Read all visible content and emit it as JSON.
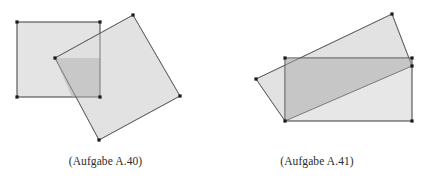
{
  "page": {
    "background_color": "#ffffff",
    "width": 423,
    "height": 186
  },
  "style": {
    "shape_fill": "#e2e2e2",
    "shape_fill_alt": "#e6e6e6",
    "overlap_fill": "#c9c9c9",
    "stroke_color": "#4a4a4a",
    "vertex_color": "#1a1a1a",
    "caption_color": "#2b2b2b"
  },
  "figures": [
    {
      "id": "a40",
      "caption": "(Aufgabe A.40)",
      "shapes": [
        {
          "name": "axis-aligned-square",
          "points": "17,22 100,22 100,97 17,97",
          "vertices": [
            [
              17,
              22
            ],
            [
              100,
              22
            ],
            [
              100,
              97
            ],
            [
              17,
              97
            ]
          ]
        },
        {
          "name": "rotated-square",
          "points": "133,15 180,96 99,140 55,58",
          "vertices": [
            [
              133,
              15
            ],
            [
              180,
              96
            ],
            [
              99,
              140
            ],
            [
              55,
              58
            ]
          ]
        },
        {
          "name": "overlap-region",
          "points": "55,58 100,58 100,97 72,97"
        }
      ]
    },
    {
      "id": "a41",
      "caption": "(Aufgabe A.41)",
      "shapes": [
        {
          "name": "axis-aligned-rectangle",
          "points": "74,58 201,58 201,121 74,121",
          "vertices": [
            [
              74,
              58
            ],
            [
              201,
              58
            ],
            [
              201,
              121
            ],
            [
              74,
              121
            ]
          ]
        },
        {
          "name": "rotated-rectangle",
          "points": "181,14 201,66 74,121 45,79",
          "vertices": [
            [
              181,
              14
            ],
            [
              201,
              66
            ],
            [
              74,
              121
            ],
            [
              45,
              79
            ]
          ]
        },
        {
          "name": "overlap-region",
          "points": "74,58 201,58 201,66 74,121"
        }
      ]
    }
  ]
}
